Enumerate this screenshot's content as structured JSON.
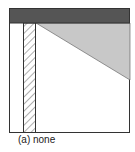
{
  "figure": {
    "caption": "(a) none",
    "colors": {
      "frame": "#333333",
      "top_bar": "#555555",
      "triangle_fill": "#c8c8c8",
      "hatch": "#333333",
      "background": "#ffffff"
    },
    "elements": [
      {
        "name": "top-bar",
        "type": "solid-rectangle"
      },
      {
        "name": "hatched-column",
        "type": "hatched-rectangle"
      },
      {
        "name": "shaded-triangle",
        "type": "gray-wedge"
      }
    ]
  }
}
